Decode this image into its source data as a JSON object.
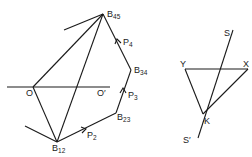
{
  "figure": {
    "left": {
      "points": {
        "B45": {
          "label": "B",
          "sub": "45"
        },
        "B34": {
          "label": "B",
          "sub": "34"
        },
        "B23": {
          "label": "B",
          "sub": "23"
        },
        "B12": {
          "label": "B",
          "sub": "12"
        },
        "O": {
          "label": "O"
        },
        "O_prime": {
          "label": "O′"
        }
      },
      "forces": {
        "P2": {
          "label": "P",
          "sub": "2"
        },
        "P3": {
          "label": "P",
          "sub": "3"
        },
        "P4": {
          "label": "P",
          "sub": "4"
        }
      }
    },
    "right": {
      "points": {
        "S": {
          "label": "S"
        },
        "S_prime": {
          "label": "S′"
        },
        "Y": {
          "label": "Y"
        },
        "X": {
          "label": "X"
        },
        "K": {
          "label": "K"
        }
      }
    }
  }
}
